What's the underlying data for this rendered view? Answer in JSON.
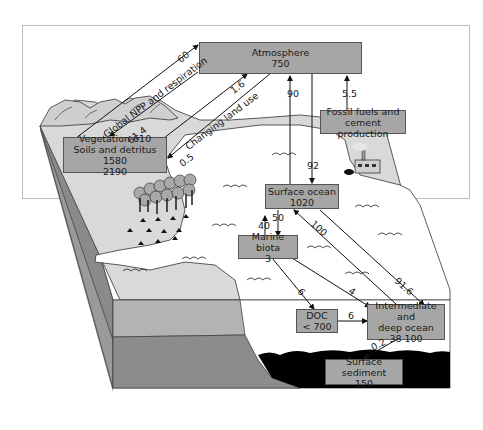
{
  "diagram": {
    "reservoirs": {
      "atmosphere": {
        "name": "Atmosphere",
        "value": "750"
      },
      "vegetation": {
        "line1": "Vegetation 610",
        "line2": "Soils and detritus 1580",
        "line3": "2190"
      },
      "fossil": {
        "line1": "Fossil fuels and",
        "line2": "cement production"
      },
      "surface_ocean": {
        "name": "Surface ocean",
        "value": "1020"
      },
      "marine_biota": {
        "name": "Marine biota",
        "value": "3"
      },
      "doc": {
        "name": "DOC",
        "value": "< 700"
      },
      "deep_ocean": {
        "line1": "Intermediate and",
        "line2": "deep ocean",
        "value": "38 100"
      },
      "sediment": {
        "name": "Surface sediment",
        "value": "150"
      }
    },
    "fluxes": {
      "veg_to_atm": "60",
      "atm_to_veg": "61.4",
      "npp_label": "Global NPP and respiration",
      "land_use_up": "1.6",
      "land_use_down": "0.5",
      "land_use_label": "Changing land use",
      "ocean_to_atm": "90",
      "atm_to_ocean": "92",
      "fossil_to_atm": "5.5",
      "biota_to_surface": "40",
      "surface_to_biota": "50",
      "deep_to_surface": "100",
      "surface_to_deep": "91.6",
      "biota_to_doc": "6",
      "biota_to_deep": "4",
      "doc_to_deep": "6",
      "deep_to_sediment": "0.2"
    },
    "colors": {
      "box_fill": "#a6a6a6",
      "land_light": "#d9d9d9",
      "slab_mid": "#b3b3b3",
      "slab_dark": "#8c8c8c",
      "sediment": "#000000"
    }
  }
}
